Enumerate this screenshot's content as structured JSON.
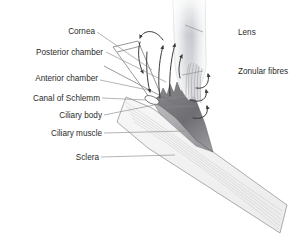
{
  "figure": {
    "background_color": "#ffffff",
    "text_color": "#2b2b2b",
    "leader_color": "#8d8d8d",
    "outline_color": "#6f6f6f",
    "arrow_color": "#3a3a3a"
  },
  "labels_left": [
    {
      "id": "cornea",
      "text": "Cornea"
    },
    {
      "id": "posterior-chamber",
      "text": "Posterior chamber"
    },
    {
      "id": "anterior-chamber",
      "text": "Anterior chamber"
    },
    {
      "id": "canal-of-schlemm",
      "text": "Canal of Schlemm"
    },
    {
      "id": "ciliary-body",
      "text": "Ciliary body"
    },
    {
      "id": "ciliary-muscle",
      "text": "Ciliary muscle"
    },
    {
      "id": "sclera",
      "text": "Sclera"
    }
  ],
  "labels_right": [
    {
      "id": "lens",
      "text": "Lens"
    },
    {
      "id": "zonular-fibres",
      "text": "Zonular fibres"
    }
  ],
  "structures": [
    {
      "id": "lens",
      "name": "Lens",
      "fill": "#e9ebec",
      "note": "vertical gradient, darker at core"
    },
    {
      "id": "cornea",
      "name": "Cornea",
      "fill": "#ffffff",
      "note": "thin transparent wedge, outlined"
    },
    {
      "id": "ciliary-body",
      "name": "Ciliary body",
      "fill": "#77777a",
      "note": "dark grey wedge with jagged ciliary processes"
    },
    {
      "id": "ciliary-muscle",
      "name": "Ciliary muscle",
      "fill": "#a9a9ad",
      "note": "mid grey band beneath ciliary body"
    },
    {
      "id": "sclera",
      "name": "Sclera",
      "fill": "#f2f2f2",
      "note": "pale striated band running lower-right"
    },
    {
      "id": "canal-of-schlemm",
      "name": "Canal of Schlemm",
      "fill": "#ffffff",
      "note": "small ellipse at the iridocorneal angle"
    },
    {
      "id": "zonular-fibres",
      "name": "Zonular fibres",
      "fill": "#cfcfd2",
      "note": "fine fibres from ciliary body to lens"
    }
  ],
  "flow_arrows": {
    "name": "aqueous humour flow",
    "count": 9,
    "color": "#3a3a3a"
  }
}
